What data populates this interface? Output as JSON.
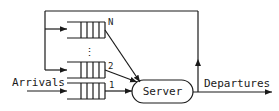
{
  "diagram": {
    "labels": {
      "arrivals": "Arrivals",
      "departures": "Departures",
      "server": "Server",
      "ellipsis": "⋮"
    },
    "queues": [
      {
        "id": "queue-n",
        "label": "N"
      },
      {
        "id": "queue-2",
        "label": "2"
      },
      {
        "id": "queue-1",
        "label": "1"
      }
    ],
    "edges": [
      {
        "from": "arrivals",
        "to": "queue-1"
      },
      {
        "from": "queue-1",
        "to": "server"
      },
      {
        "from": "queue-2",
        "to": "server"
      },
      {
        "from": "queue-n",
        "to": "server"
      },
      {
        "from": "server",
        "to": "departures"
      },
      {
        "from": "server",
        "to": "queue-2",
        "type": "feedback"
      },
      {
        "from": "server",
        "to": "queue-n",
        "type": "feedback"
      }
    ],
    "colors": {
      "stroke": "#1a1a1a",
      "background": "#ffffff"
    }
  }
}
